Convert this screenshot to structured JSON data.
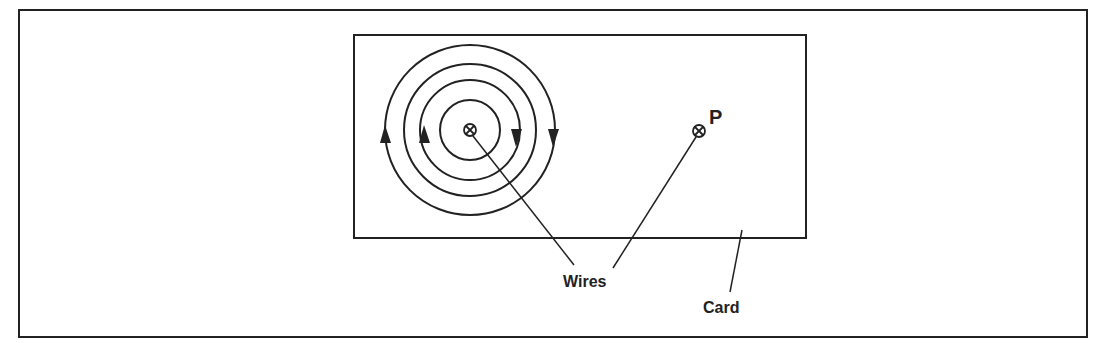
{
  "diagram": {
    "labels": {
      "wires": "Wires",
      "card": "Card",
      "point": "P"
    },
    "colors": {
      "line": "#222222",
      "background": "#ffffff"
    },
    "elements": {
      "circles_count": 4,
      "wire_a_symbol": "cross-circle (current into page)",
      "wire_p_symbol": "cross-circle (current into page)"
    }
  }
}
